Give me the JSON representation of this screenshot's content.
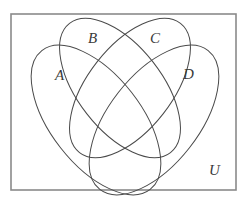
{
  "diagram": {
    "type": "venn",
    "universe_label": "U",
    "sets": [
      {
        "id": "A",
        "label": "A"
      },
      {
        "id": "B",
        "label": "B"
      },
      {
        "id": "C",
        "label": "C"
      },
      {
        "id": "D",
        "label": "D"
      }
    ],
    "colors": {
      "outline": "#4a4a4a",
      "frame": "#8a8a8a",
      "background": "#ffffff"
    }
  }
}
